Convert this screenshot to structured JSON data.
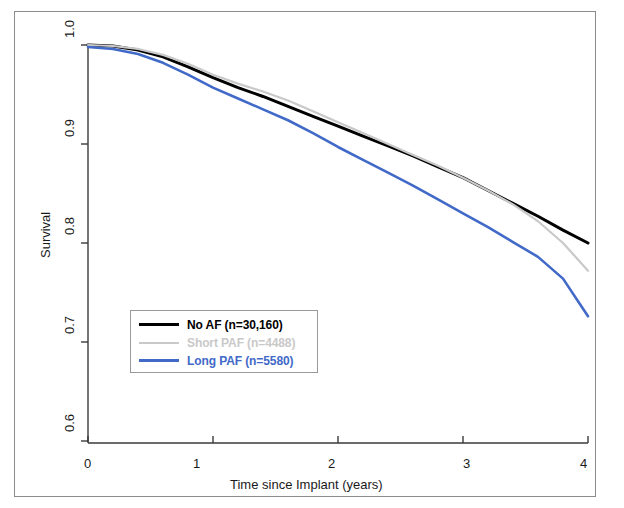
{
  "chart_data": {
    "type": "line",
    "title": "",
    "subtitle": "",
    "xlabel": "Time since Implant (years)",
    "ylabel": "Survival",
    "xlim": [
      0,
      4
    ],
    "ylim": [
      0.6,
      1.0
    ],
    "xticks": [
      "0",
      "1",
      "2",
      "3",
      "4"
    ],
    "yticks": [
      "0.6",
      "0.7",
      "0.8",
      "0.9",
      "1.0"
    ],
    "grid": false,
    "legend_position": "lower-left-inside",
    "x": [
      0,
      0.2,
      0.4,
      0.6,
      0.8,
      1.0,
      1.2,
      1.4,
      1.6,
      1.8,
      2.0,
      2.2,
      2.4,
      2.6,
      2.8,
      3.0,
      3.2,
      3.4,
      3.6,
      3.8,
      4.0
    ],
    "series": [
      {
        "name": "No AF (n=30,160)",
        "label": "No AF (n=30,160)",
        "color": "#000000",
        "n": "30,160",
        "values": [
          1.0,
          0.999,
          0.995,
          0.988,
          0.978,
          0.967,
          0.957,
          0.948,
          0.938,
          0.928,
          0.918,
          0.908,
          0.898,
          0.888,
          0.877,
          0.866,
          0.853,
          0.84,
          0.827,
          0.813,
          0.8
        ]
      },
      {
        "name": "Short PAF (n=4488)",
        "label": "Short PAF (n=4488)",
        "color": "#c9c9c9",
        "n": "4488",
        "values": [
          1.0,
          0.999,
          0.996,
          0.99,
          0.981,
          0.97,
          0.961,
          0.953,
          0.944,
          0.933,
          0.922,
          0.911,
          0.9,
          0.889,
          0.878,
          0.866,
          0.853,
          0.839,
          0.822,
          0.8,
          0.772
        ]
      },
      {
        "name": "Long PAF (n=5580)",
        "label": "Long PAF (n=5580)",
        "color": "#4169c8",
        "n": "5580",
        "values": [
          0.998,
          0.996,
          0.991,
          0.982,
          0.97,
          0.957,
          0.946,
          0.935,
          0.924,
          0.911,
          0.897,
          0.884,
          0.871,
          0.858,
          0.844,
          0.83,
          0.816,
          0.801,
          0.786,
          0.764,
          0.726
        ]
      }
    ]
  },
  "axes": {
    "y_title": "Survival",
    "x_title": "Time since Implant (years)",
    "y_tick_labels": [
      "1.0",
      "0.9",
      "0.8",
      "0.7",
      "0.6"
    ],
    "x_tick_labels": [
      "0",
      "1",
      "2",
      "3",
      "4"
    ]
  },
  "legend": {
    "entries": [
      {
        "label": "No AF (n=30,160)",
        "color": "#000000"
      },
      {
        "label": "Short PAF (n=4488)",
        "color": "#c9c9c9"
      },
      {
        "label": "Long PAF (n=5580)",
        "color": "#4169c8"
      }
    ]
  }
}
